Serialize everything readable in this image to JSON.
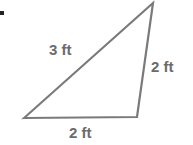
{
  "diagram": {
    "shape": "triangle",
    "stroke_color": "#7a7a7a",
    "label_color": "#6b6b6b",
    "vertices": [
      [
        24,
        118
      ],
      [
        137,
        117
      ],
      [
        153,
        3
      ]
    ],
    "labels": {
      "hypotenuse": "3 ft",
      "right_side": "2 ft",
      "bottom_side": "2 ft"
    }
  }
}
